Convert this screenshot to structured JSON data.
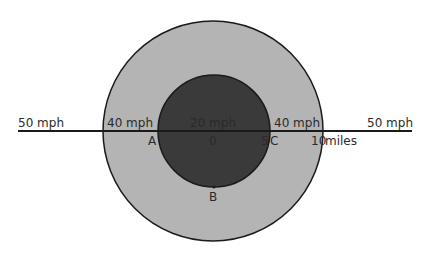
{
  "diagram": {
    "colors": {
      "background": "#ffffff",
      "outer_zone": "#b4b4b4",
      "inner_zone": "#3a3a3a",
      "line": "#1a1a1a",
      "text": "#2a2a2a"
    },
    "zones": {
      "outside_left": "50 mph",
      "outside_right": "50 mph",
      "outer_left": "40 mph",
      "outer_right": "40 mph",
      "inner": "20 mph"
    },
    "points": {
      "A": "A",
      "B": "B",
      "C": "C",
      "origin": "0"
    },
    "scale": {
      "inner_radius": "5",
      "outer_radius": "10",
      "unit": "miles"
    }
  }
}
